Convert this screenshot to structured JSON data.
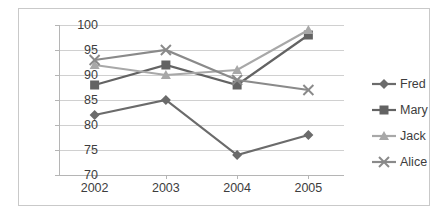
{
  "chart_data": {
    "type": "line",
    "title": "",
    "xlabel": "",
    "ylabel": "",
    "categories": [
      "2002",
      "2003",
      "2004",
      "2005"
    ],
    "ylim": [
      70,
      100
    ],
    "yticks": [
      70,
      75,
      80,
      85,
      90,
      95,
      100
    ],
    "grid": true,
    "legend_position": "right",
    "series": [
      {
        "name": "Fred",
        "values": [
          82,
          85,
          74,
          78
        ],
        "marker": "diamond",
        "color": "#6b6b6b"
      },
      {
        "name": "Mary",
        "values": [
          88,
          92,
          88,
          98
        ],
        "marker": "square",
        "color": "#636363"
      },
      {
        "name": "Jack",
        "values": [
          92,
          90,
          91,
          99
        ],
        "marker": "triangle",
        "color": "#a8a8a8"
      },
      {
        "name": "Alice",
        "values": [
          93,
          95,
          89,
          87
        ],
        "marker": "cross",
        "color": "#8a8a8a"
      }
    ]
  },
  "axis": {
    "y_labels": [
      "100",
      "95",
      "90",
      "85",
      "80",
      "75",
      "70"
    ],
    "x_labels": [
      "2002",
      "2003",
      "2004",
      "2005"
    ]
  },
  "legend": {
    "entries": [
      {
        "label": "Fred"
      },
      {
        "label": "Mary"
      },
      {
        "label": "Jack"
      },
      {
        "label": "Alice"
      }
    ]
  }
}
